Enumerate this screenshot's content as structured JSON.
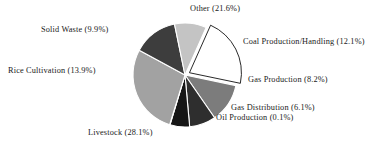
{
  "chart_data": {
    "type": "pie",
    "title": "",
    "subtitle": "",
    "xlabel": "",
    "ylabel": "",
    "legend_position": "none",
    "grid": false,
    "labels_format": "name (value%)",
    "units": "percent",
    "start_angle_deg": -66,
    "direction": "clockwise",
    "categories": [
      "Other",
      "Coal Production/Handling",
      "Gas Production",
      "Gas Distribution",
      "Oil Production",
      "Livestock",
      "Rice Cultivation",
      "Solid Waste"
    ],
    "values": [
      21.6,
      12.1,
      8.2,
      6.1,
      0.1,
      28.1,
      13.9,
      9.9
    ],
    "slices": [
      {
        "name": "Other",
        "value": 21.6,
        "label": "Other (21.6%)",
        "color": "#ffffff",
        "stroke": "#111111",
        "exploded": true
      },
      {
        "name": "Coal Production/Handling",
        "value": 12.1,
        "label": "Coal Production/Handling (12.1%)",
        "color": "#7c7c7c",
        "stroke": "#ffffff",
        "exploded": false
      },
      {
        "name": "Gas Production",
        "value": 8.2,
        "label": "Gas Production (8.2%)",
        "color": "#2e2e2e",
        "stroke": "#ffffff",
        "exploded": false
      },
      {
        "name": "Gas Distribution",
        "value": 6.1,
        "label": "Gas Distribution (6.1%)",
        "color": "#161616",
        "stroke": "#ffffff",
        "exploded": false
      },
      {
        "name": "Oil Production",
        "value": 0.1,
        "label": "Oil Production (0.1%)",
        "color": "#9a9a9a",
        "stroke": "#ffffff",
        "exploded": false
      },
      {
        "name": "Livestock",
        "value": 28.1,
        "label": "Livestock (28.1%)",
        "color": "#a2a2a2",
        "stroke": "#ffffff",
        "exploded": false
      },
      {
        "name": "Rice Cultivation",
        "value": 13.9,
        "label": "Rice Cultivation (13.9%)",
        "color": "#3d3d3d",
        "stroke": "#ffffff",
        "exploded": false
      },
      {
        "name": "Solid Waste",
        "value": 9.9,
        "label": "Solid Waste (9.9%)",
        "color": "#c4c4c4",
        "stroke": "#ffffff",
        "exploded": false
      }
    ]
  },
  "labels": {
    "other": "Other (21.6%)",
    "coal": "Coal Production/Handling (12.1%)",
    "gas_production": "Gas Production (8.2%)",
    "gas_distribution": "Gas Distribution (6.1%)",
    "oil_production": "Oil Production (0.1%)",
    "livestock": "Livestock (28.1%)",
    "rice_cultivation": "Rice Cultivation (13.9%)",
    "solid_waste": "Solid Waste (9.9%)"
  },
  "geometry": {
    "center_x": 185,
    "center_y": 75,
    "radius": 52,
    "explode_offset": 5
  }
}
